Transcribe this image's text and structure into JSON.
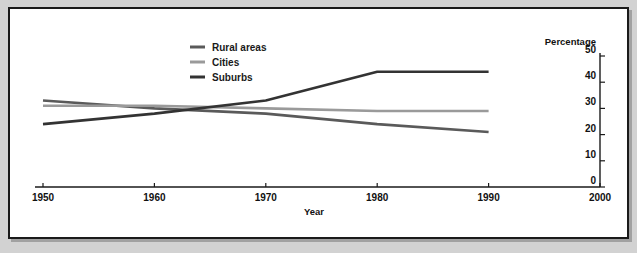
{
  "figure": {
    "background_color": "#d2d2d2",
    "panel_color": "#ffffff",
    "border_color": "#1a1a1a"
  },
  "axes": {
    "x_title": "Year",
    "y_title": "Percentage",
    "x_ticks": [
      "1950",
      "1960",
      "1970",
      "1980",
      "1990",
      "2000"
    ],
    "y_ticks": [
      "0",
      "10",
      "20",
      "30",
      "40",
      "50"
    ]
  },
  "legend": {
    "position": "top-center",
    "items": [
      {
        "label": "Rural areas",
        "color": "#5a5a5a"
      },
      {
        "label": "Cities",
        "color": "#9a9a9a"
      },
      {
        "label": "Suburbs",
        "color": "#333333"
      }
    ]
  },
  "chart_data": {
    "type": "line",
    "title": "",
    "xlabel": "Year",
    "ylabel": "Percentage",
    "x": [
      1950,
      1960,
      1970,
      1980,
      1990
    ],
    "xlim": [
      1950,
      2000
    ],
    "ylim": [
      0,
      50
    ],
    "grid": false,
    "legend_position": "top-center",
    "series": [
      {
        "name": "Rural areas",
        "color": "#5a5a5a",
        "values": [
          33,
          30,
          28,
          24,
          21
        ]
      },
      {
        "name": "Cities",
        "color": "#9a9a9a",
        "values": [
          31,
          31,
          30,
          29,
          29
        ]
      },
      {
        "name": "Suburbs",
        "color": "#333333",
        "values": [
          24,
          28,
          33,
          44,
          44
        ]
      }
    ]
  }
}
